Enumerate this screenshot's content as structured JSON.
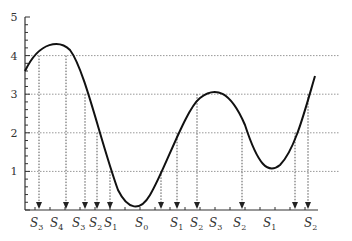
{
  "chart_data": {
    "type": "line",
    "title": "",
    "xlabel": "",
    "ylabel": "",
    "ylim": [
      0,
      5
    ],
    "yticks": [
      1,
      2,
      3,
      4,
      5
    ],
    "grid": {
      "horizontal": true,
      "vertical": false,
      "style": "dotted"
    },
    "legend": null,
    "series": [
      {
        "name": "curve",
        "color": "#111111",
        "points_px": "M25,71 C40,40 60,40 70,50 C85,70 100,140 118,190 C128,210 140,212 150,195 C165,170 185,110 200,98 C215,86 230,90 245,125 C258,165 268,175 280,165 C295,150 305,110 315,76",
        "approx_shape": "starts ~3.5, peaks ~4.2, falls to min ~0.1, rises to local max ~3.1, dips to local min ~1.05, ends rising past ~3.5"
      }
    ],
    "projections": [
      {
        "label": "S3",
        "base": "S",
        "sub": "3",
        "x_px": 39,
        "level": 4
      },
      {
        "label": "S4",
        "base": "S",
        "sub": "4",
        "x_px": 50,
        "level": null
      },
      {
        "label": "S3",
        "base": "S",
        "sub": "3",
        "x_px": 66,
        "level": 4
      },
      {
        "label": "S2",
        "base": "S",
        "sub": "2",
        "x_px": 85,
        "level": 3
      },
      {
        "label": "S1",
        "base": "S",
        "sub": "1",
        "x_px": 97,
        "level": 2
      },
      {
        "label": "S0",
        "base": "S",
        "sub": "0",
        "x_px": 110,
        "level": 1
      },
      {
        "label": "S1",
        "base": "S",
        "sub": "1",
        "x_px": 161,
        "level": 1
      },
      {
        "label": "S2",
        "base": "S",
        "sub": "2",
        "x_px": 177,
        "level": 2
      },
      {
        "label": "S3",
        "base": "S",
        "sub": "3",
        "x_px": 197,
        "level": 3
      },
      {
        "label": "S2",
        "base": "S",
        "sub": "2",
        "x_px": 218,
        "level": 3
      },
      {
        "label": "S1",
        "base": "S",
        "sub": "1",
        "x_px": 239,
        "level": 2
      },
      {
        "label": "S2",
        "base": "S",
        "sub": "2",
        "x_px": 295,
        "level": 2
      },
      {
        "label": "S2",
        "base": "S",
        "sub": "2",
        "x_px": 308,
        "level": 3
      }
    ],
    "arrow_x_px": [
      39,
      66,
      85,
      97,
      110,
      161,
      177,
      197,
      242,
      295,
      308
    ],
    "x_labels": [
      {
        "text": "S",
        "sub": "3",
        "x": 30
      },
      {
        "text": "S",
        "sub": "4",
        "x": 50
      },
      {
        "text": "S",
        "sub": "3",
        "x": 72
      },
      {
        "text": "S",
        "sub": "2",
        "x": 89
      },
      {
        "text": "S",
        "sub": "1",
        "x": 104
      },
      {
        "text": "S",
        "sub": "0",
        "x": 135
      },
      {
        "text": "S",
        "sub": "1",
        "x": 170
      },
      {
        "text": "S",
        "sub": "2",
        "x": 190
      },
      {
        "text": "S",
        "sub": "3",
        "x": 209
      },
      {
        "text": "S",
        "sub": "2",
        "x": 233
      },
      {
        "text": "S",
        "sub": "1",
        "x": 263
      },
      {
        "text": "S",
        "sub": "2",
        "x": 304
      }
    ]
  }
}
